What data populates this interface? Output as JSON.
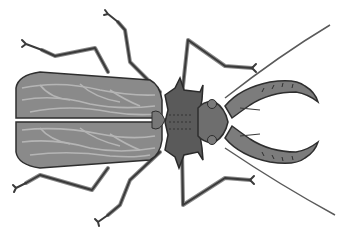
{
  "image": {
    "subject": "beetle illustration",
    "background": "#ffffff",
    "colors": {
      "elytra": "#8a8a8a",
      "elytra_vein": "#b8b8b8",
      "thorax": "#5a5a5a",
      "outline": "#2e2e2e",
      "legs": "#9a9a9a",
      "mandible": "#7c7c7c"
    }
  }
}
